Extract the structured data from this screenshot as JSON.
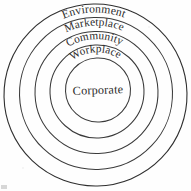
{
  "diagram": {
    "background_color": "#fefefe",
    "stroke_color": "#3a3a3a",
    "text_color": "#2b2b2b",
    "center_label": "Corporate",
    "rings": [
      {
        "label": "Environment",
        "level": 5,
        "cx": 95.5,
        "cy": 95.0,
        "rx": 91.5,
        "ry": 91.0,
        "rotation": -1.2,
        "label_offset": 8.5,
        "label_sweep": 1
      },
      {
        "label": "Marketplace",
        "level": 4,
        "cx": 96.0,
        "cy": 93.5,
        "rx": 76.5,
        "ry": 76.0,
        "rotation": -1.6,
        "label_offset": 8.0,
        "label_sweep": 1
      },
      {
        "label": "Community",
        "level": 3,
        "cx": 96.5,
        "cy": 92.5,
        "rx": 61.5,
        "ry": 61.0,
        "rotation": -2.0,
        "label_offset": 7.6,
        "label_sweep": 1
      },
      {
        "label": "Workplace",
        "level": 2,
        "cx": 97.0,
        "cy": 91.5,
        "rx": 47.0,
        "ry": 46.5,
        "rotation": -2.4,
        "label_offset": 7.2,
        "label_sweep": 1
      },
      {
        "label": "Corporate",
        "level": 1,
        "cx": 98.0,
        "cy": 90.0,
        "rx": 32.5,
        "ry": 32.0,
        "rotation": -2.6,
        "label_offset": 0,
        "label_sweep": 0
      }
    ],
    "corner_artifact": {
      "name": "scan-artifact",
      "color": "#c9c9c9"
    }
  }
}
